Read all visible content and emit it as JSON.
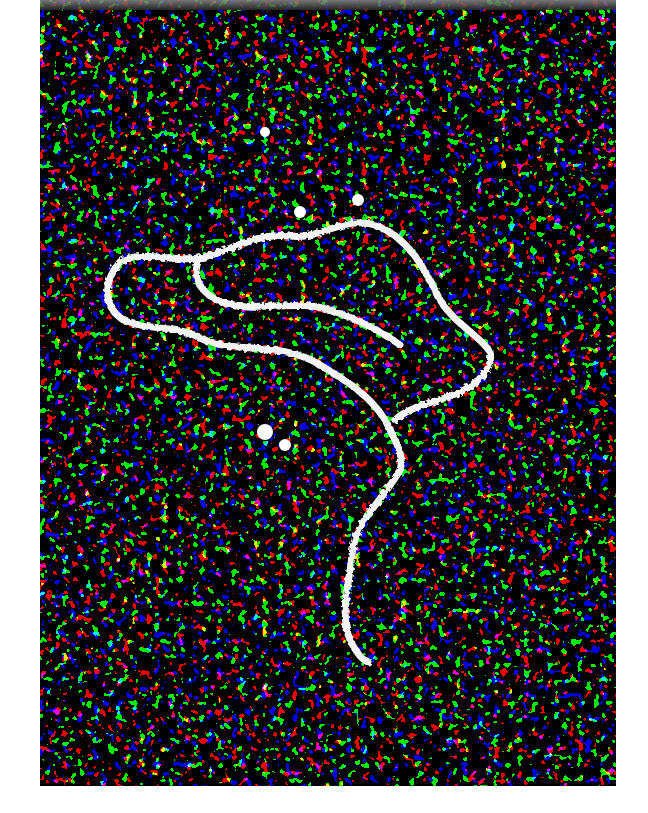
{
  "image": {
    "subject": "electron micrograph of a single DNA molecule with a loop and tail on a granular background",
    "colors": {
      "background": "#0a0a0a",
      "grain": "#e6e6e6",
      "strand": "#f4f4f4",
      "page": "#ffffff"
    },
    "strand_path": "M120,262 C100,285 105,312 128,322 C150,330 180,326 200,338 C235,355 280,340 320,365 C345,380 370,395 385,420 C395,440 405,455 400,470 C380,505 355,520 352,555 C348,590 340,615 350,640 C356,652 362,660 368,662",
    "loop_path": "M120,262 C140,250 175,262 200,258 C230,252 255,232 290,236 C320,240 345,215 375,225 C410,238 425,270 440,300 C455,325 480,335 490,352 C495,372 470,390 445,398 C425,404 405,410 395,420 M200,258 C190,275 200,300 235,305 C270,310 300,300 330,310 C360,320 380,330 400,345"
  }
}
